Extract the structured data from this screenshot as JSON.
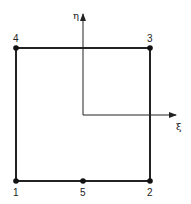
{
  "diagram": {
    "title": "",
    "element": {
      "nodes": [
        {
          "id": "1",
          "label": "1",
          "x": 16,
          "y": 181,
          "lx": 13,
          "ly": 196
        },
        {
          "id": "2",
          "label": "2",
          "x": 150,
          "y": 181,
          "lx": 147,
          "ly": 196
        },
        {
          "id": "3",
          "label": "3",
          "x": 150,
          "y": 48,
          "lx": 147,
          "ly": 42
        },
        {
          "id": "4",
          "label": "4",
          "x": 16,
          "y": 48,
          "lx": 13,
          "ly": 42
        },
        {
          "id": "5",
          "label": "5",
          "x": 83,
          "y": 181,
          "lx": 80,
          "ly": 196
        }
      ],
      "edges": [
        [
          "1",
          "5"
        ],
        [
          "5",
          "2"
        ],
        [
          "2",
          "3"
        ],
        [
          "3",
          "4"
        ],
        [
          "4",
          "1"
        ]
      ]
    },
    "axes": {
      "origin": {
        "x": 83,
        "y": 115
      },
      "xi": {
        "label": "ξ",
        "tip": {
          "x": 176,
          "y": 115
        },
        "label_pos": {
          "x": 176,
          "y": 130
        }
      },
      "eta": {
        "label": "η",
        "tip": {
          "x": 83,
          "y": 14
        },
        "label_pos": {
          "x": 73,
          "y": 19
        }
      }
    },
    "colors": {
      "stroke": "#222222",
      "node": "#111111",
      "background": "#ffffff"
    }
  }
}
